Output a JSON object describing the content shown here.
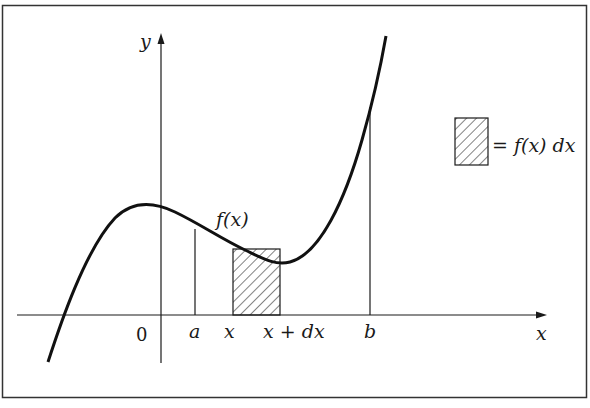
{
  "figure": {
    "colors": {
      "stroke": "#1a1a1a",
      "background": "#ffffff",
      "frame": "#333333"
    }
  },
  "axes": {
    "x_label": "x",
    "y_label": "y",
    "origin_label": "0"
  },
  "ticks": {
    "a": "a",
    "x": "x",
    "x_plus_dx": "x + dx",
    "b": "b"
  },
  "curve": {
    "label": "f(x)"
  },
  "legend": {
    "text": "= f(x) dx",
    "swatch": "hatched-rectangle"
  }
}
